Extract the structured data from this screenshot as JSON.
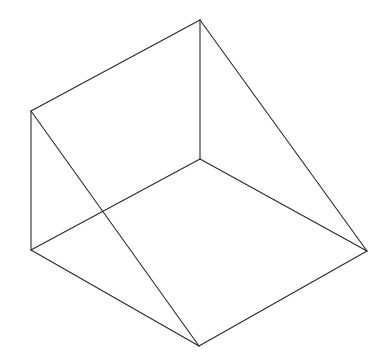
{
  "diagram": {
    "type": "wireframe-wedge",
    "stroke_color": "#2a2a2a",
    "background": "#ffffff",
    "vertices": {
      "top": [
        200,
        20
      ],
      "upper_left": [
        31,
        111
      ],
      "inner_back": [
        200,
        159
      ],
      "lower_left": [
        31,
        250
      ],
      "right": [
        367,
        251
      ],
      "bottom": [
        199,
        346
      ]
    },
    "edges": [
      {
        "name": "top-edge",
        "from": "upper_left",
        "to": "top"
      },
      {
        "name": "back-vertical-edge",
        "from": "top",
        "to": "inner_back"
      },
      {
        "name": "top-to-right-edge",
        "from": "top",
        "to": "right"
      },
      {
        "name": "left-vertical-edge",
        "from": "upper_left",
        "to": "lower_left"
      },
      {
        "name": "upper-left-to-bottom-edge",
        "from": "upper_left",
        "to": "bottom"
      },
      {
        "name": "inner-back-to-lower-left-edge",
        "from": "inner_back",
        "to": "lower_left"
      },
      {
        "name": "inner-back-to-right-edge",
        "from": "inner_back",
        "to": "right"
      },
      {
        "name": "lower-left-to-bottom-edge",
        "from": "lower_left",
        "to": "bottom"
      },
      {
        "name": "bottom-to-right-edge",
        "from": "bottom",
        "to": "right"
      }
    ]
  }
}
